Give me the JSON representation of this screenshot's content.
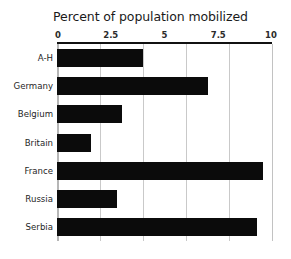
{
  "chart_data": {
    "type": "bar",
    "orientation": "horizontal",
    "title": "Percent of population mobilized",
    "xlabel": "",
    "ylabel": "",
    "categories": [
      "A-H",
      "Germany",
      "Belgium",
      "Britain",
      "France",
      "Russia",
      "Serbia"
    ],
    "values": [
      4.0,
      7.0,
      3.0,
      1.6,
      9.6,
      2.8,
      9.3
    ],
    "xlim": [
      0,
      10
    ],
    "x_tick_labels": [
      "0",
      "2.5",
      "5",
      "7.5",
      "10"
    ],
    "x_tick_values": [
      0,
      2.5,
      5,
      7.5,
      10
    ],
    "gridline_values": [
      0,
      2,
      4,
      6,
      8,
      10
    ],
    "grid": true,
    "axis_position": "top",
    "legend": "none",
    "bar_color": "#0b0b0b",
    "grid_color": "#c9c9c9",
    "axis_color": "#111111",
    "background_color": "#ffffff"
  }
}
